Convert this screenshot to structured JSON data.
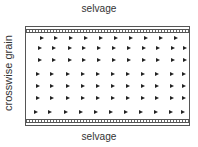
{
  "labels": {
    "top": "selvage",
    "bottom": "selvage",
    "side": "crosswise grain"
  },
  "colors": {
    "line": "#555555",
    "arrow": "#222222",
    "text": "#333333"
  },
  "arrow_rows": [
    {
      "y": 9,
      "xs": [
        14,
        28,
        43,
        58,
        73,
        88,
        103,
        118,
        133,
        148
      ]
    },
    {
      "y": 19,
      "xs": [
        12,
        26,
        42,
        56,
        71,
        86,
        101,
        116,
        130,
        145,
        157
      ]
    },
    {
      "y": 31,
      "xs": [
        12,
        26,
        42,
        56,
        71,
        86,
        101,
        116,
        130,
        145,
        157
      ]
    },
    {
      "y": 45,
      "xs": [
        10,
        24,
        40,
        55,
        70,
        85,
        100,
        115,
        129,
        144,
        156
      ]
    },
    {
      "y": 57,
      "xs": [
        10,
        24,
        40,
        55,
        70,
        85,
        100,
        115,
        129,
        144,
        156
      ]
    },
    {
      "y": 69,
      "xs": [
        10,
        24,
        40,
        55,
        70,
        85,
        100,
        115,
        129,
        144,
        156
      ]
    },
    {
      "y": 83,
      "xs": [
        8,
        22,
        38,
        53,
        68,
        83,
        98,
        113,
        128,
        143,
        155
      ]
    }
  ]
}
